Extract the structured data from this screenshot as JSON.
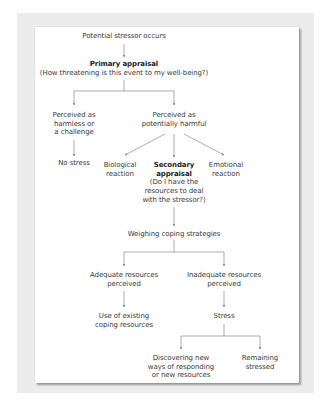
{
  "diagram": {
    "colors": {
      "backdrop": "#ececec",
      "card": "#ffffff",
      "text": "#3a3a3a",
      "connector": "#8a8a8a"
    },
    "nodes": {
      "stressor": {
        "lines": [
          "Potential stressor occurs"
        ]
      },
      "primary": {
        "title": "Primary appraisal",
        "lines": [
          "(How threatening is this event to my well-being?)"
        ]
      },
      "harmless": {
        "lines": [
          "Perceived as",
          "harmless or",
          "a challenge"
        ]
      },
      "harmful": {
        "lines": [
          "Perceived as",
          "potentially harmful"
        ]
      },
      "no_stress": {
        "lines": [
          "No stress"
        ]
      },
      "biological": {
        "lines": [
          "Biological",
          "reaction"
        ]
      },
      "secondary": {
        "title_lines": [
          "Secondary",
          "appraisal"
        ],
        "lines": [
          "(Do I have the",
          "resources to deal",
          "with the stressor?)"
        ]
      },
      "emotional": {
        "lines": [
          "Emotional",
          "reaction"
        ]
      },
      "weighing": {
        "lines": [
          "Weighing coping strategies"
        ]
      },
      "adequate": {
        "lines": [
          "Adequate resources",
          "perceived"
        ]
      },
      "inadequate": {
        "lines": [
          "Inadequate resources",
          "perceived"
        ]
      },
      "existing": {
        "lines": [
          "Use of existing",
          "coping resources"
        ]
      },
      "stress": {
        "lines": [
          "Stress"
        ]
      },
      "discovering": {
        "lines": [
          "Discovering new",
          "ways of responding",
          "or new resources"
        ]
      },
      "remaining": {
        "lines": [
          "Remaining",
          "stressed"
        ]
      }
    },
    "edges": [
      [
        "stressor",
        "primary"
      ],
      [
        "primary",
        "harmless"
      ],
      [
        "primary",
        "harmful"
      ],
      [
        "harmless",
        "no_stress"
      ],
      [
        "harmful",
        "biological"
      ],
      [
        "harmful",
        "secondary"
      ],
      [
        "harmful",
        "emotional"
      ],
      [
        "secondary",
        "weighing"
      ],
      [
        "weighing",
        "adequate"
      ],
      [
        "weighing",
        "inadequate"
      ],
      [
        "adequate",
        "existing"
      ],
      [
        "inadequate",
        "stress"
      ],
      [
        "stress",
        "discovering"
      ],
      [
        "stress",
        "remaining"
      ]
    ]
  }
}
